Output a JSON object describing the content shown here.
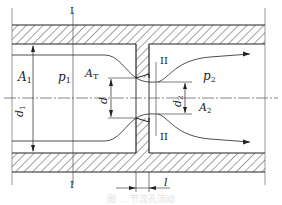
{
  "diagram": {
    "labels": {
      "A1": "A",
      "A1_sub": "1",
      "p1": "p",
      "p1_sub": "1",
      "AT": "A",
      "AT_sub": "T",
      "d1": "d",
      "d1_sub": "1",
      "d": "d",
      "d2": "d",
      "d2_sub": "2",
      "A2": "A",
      "A2_sub": "2",
      "p2": "p",
      "p2_sub": "2",
      "l": "l",
      "section1_top": "I",
      "section1_bottom": "I",
      "section2_top": "II",
      "section2_bottom": "II"
    },
    "colors": {
      "line": "#222222",
      "hatch": "#333333",
      "background": "#ffffff"
    }
  },
  "caption": "图 … 节流孔流动"
}
